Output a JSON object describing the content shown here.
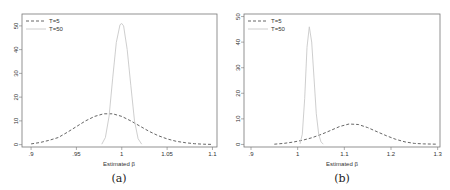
{
  "chart_data": [
    {
      "type": "line",
      "panel_label": "(a)",
      "xlabel": "Estimated β",
      "ylabel": "",
      "xlim": [
        0.89,
        1.105
      ],
      "ylim": [
        -1,
        55
      ],
      "xticks": [
        0.9,
        0.95,
        1,
        1.05,
        1.1
      ],
      "xtick_labels": [
        ".9",
        ".95",
        "1",
        "1.05",
        "1.1"
      ],
      "yticks": [
        0,
        10,
        20,
        30,
        40,
        50
      ],
      "ytick_labels": [
        "0",
        "10",
        "20",
        "30",
        "40",
        "50"
      ],
      "legend": {
        "position": "top-left",
        "entries": [
          "T=5",
          "T=50"
        ]
      },
      "grid": false,
      "series": [
        {
          "name": "T=5",
          "style": "dashed",
          "color": "#555555",
          "x": [
            0.9,
            0.91,
            0.92,
            0.93,
            0.94,
            0.95,
            0.96,
            0.97,
            0.98,
            0.99,
            1.0,
            1.01,
            1.02,
            1.03,
            1.04,
            1.05,
            1.06,
            1.07,
            1.08,
            1.09,
            1.1
          ],
          "y": [
            0.3,
            0.9,
            1.8,
            3.0,
            5.2,
            7.6,
            10.0,
            11.9,
            13.0,
            13.0,
            11.9,
            10.0,
            7.8,
            5.6,
            3.8,
            2.4,
            1.4,
            0.8,
            0.4,
            0.2,
            0.1
          ]
        },
        {
          "name": "T=50",
          "style": "solid",
          "color": "#c8c8c8",
          "x": [
            0.978,
            0.982,
            0.986,
            0.99,
            0.994,
            0.998,
            1.0,
            1.002,
            1.006,
            1.01,
            1.014,
            1.018,
            1.022
          ],
          "y": [
            0.2,
            3.0,
            12.0,
            28.0,
            43.0,
            50.5,
            51.0,
            50.0,
            40.0,
            25.0,
            10.0,
            2.5,
            0.2
          ]
        }
      ]
    },
    {
      "type": "line",
      "panel_label": "(b)",
      "xlabel": "Estimated β",
      "ylabel": "",
      "xlim": [
        0.885,
        1.305
      ],
      "ylim": [
        -1,
        51
      ],
      "xticks": [
        0.9,
        1,
        1.1,
        1.2,
        1.3
      ],
      "xtick_labels": [
        ".9",
        "1",
        "1.1",
        "1.2",
        "1.3"
      ],
      "yticks": [
        0,
        10,
        20,
        30,
        40,
        50
      ],
      "ytick_labels": [
        "0",
        "10",
        "20",
        "30",
        "40",
        "50"
      ],
      "legend": {
        "position": "top-left",
        "entries": [
          "T=5",
          "T=50"
        ]
      },
      "grid": false,
      "series": [
        {
          "name": "T=5",
          "style": "dashed",
          "color": "#555555",
          "x": [
            0.95,
            0.97,
            0.99,
            1.01,
            1.03,
            1.05,
            1.07,
            1.09,
            1.11,
            1.13,
            1.15,
            1.17,
            1.19,
            1.21,
            1.23,
            1.25,
            1.27,
            1.3
          ],
          "y": [
            0.1,
            0.4,
            0.9,
            1.6,
            2.6,
            3.9,
            5.4,
            7.0,
            8.0,
            7.8,
            6.6,
            5.0,
            3.4,
            2.0,
            1.0,
            0.4,
            0.2,
            0.1
          ]
        },
        {
          "name": "T=50",
          "style": "solid",
          "color": "#c8c8c8",
          "x": [
            1.005,
            1.01,
            1.015,
            1.02,
            1.025,
            1.03,
            1.035,
            1.04,
            1.045,
            1.05,
            1.055
          ],
          "y": [
            0.2,
            4.0,
            18.0,
            38.0,
            46.0,
            40.0,
            26.0,
            12.0,
            4.0,
            1.0,
            0.1
          ]
        }
      ]
    }
  ],
  "captions": {
    "a": "(a)",
    "b": "(b)"
  },
  "axis_titles": {
    "a": "Estimated β",
    "b": "Estimated β"
  }
}
